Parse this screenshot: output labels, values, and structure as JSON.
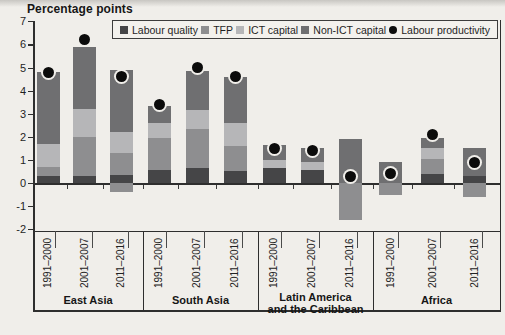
{
  "title": "Percentage points",
  "legend": {
    "items": [
      {
        "key": "labour_quality",
        "label": "Labour quality",
        "swatch": "square"
      },
      {
        "key": "tfp",
        "label": "TFP",
        "swatch": "square"
      },
      {
        "key": "ict_capital",
        "label": "ICT capital",
        "swatch": "square"
      },
      {
        "key": "non_ict_capital",
        "label": "Non-ICT capital",
        "swatch": "square"
      },
      {
        "key": "labour_productivity",
        "label": "Labour productivity",
        "swatch": "dot"
      }
    ]
  },
  "colors": {
    "labour_quality": "#454547",
    "tfp": "#8e8e90",
    "ict_capital": "#b6b6b8",
    "non_ict_capital": "#6f6f71",
    "labour_productivity": "#0b0b0b",
    "axis": "#2e2e2e",
    "paper": "#f0eeea"
  },
  "chart_data": {
    "type": "bar",
    "stacked": true,
    "title": "Percentage points",
    "ylabel": "Percentage points",
    "ylim": [
      -2,
      7
    ],
    "yticks": [
      7,
      6,
      5,
      4,
      3,
      2,
      1,
      0,
      -1,
      -2
    ],
    "grid": false,
    "legend_position": "top",
    "stack_order": [
      "labour_quality",
      "tfp",
      "ict_capital",
      "non_ict_capital"
    ],
    "periods": [
      "1991–2000",
      "2001–2007",
      "2011–2016"
    ],
    "groups": [
      {
        "label_lines": [
          "East Asia"
        ],
        "bars": [
          {
            "period": "1991–2000",
            "labour_quality": 0.3,
            "tfp": 0.4,
            "ict_capital": 1.0,
            "non_ict_capital": 3.1,
            "negative_segments": [],
            "labour_productivity": 4.8
          },
          {
            "period": "2001–2007",
            "labour_quality": 0.3,
            "tfp": 1.7,
            "ict_capital": 1.2,
            "non_ict_capital": 2.7,
            "negative_segments": [],
            "labour_productivity": 6.2
          },
          {
            "period": "2011–2016",
            "labour_quality": 0.35,
            "tfp": 0.95,
            "ict_capital": 0.9,
            "non_ict_capital": 2.7,
            "negative_segments": [
              {
                "category": "tfp",
                "value": -0.4
              }
            ],
            "labour_productivity": 4.6
          }
        ]
      },
      {
        "label_lines": [
          "South Asia"
        ],
        "bars": [
          {
            "period": "1991–2000",
            "labour_quality": 0.55,
            "tfp": 1.4,
            "ict_capital": 0.65,
            "non_ict_capital": 0.75,
            "negative_segments": [],
            "labour_productivity": 3.4
          },
          {
            "period": "2001–2007",
            "labour_quality": 0.65,
            "tfp": 1.7,
            "ict_capital": 0.8,
            "non_ict_capital": 1.7,
            "negative_segments": [],
            "labour_productivity": 5.0
          },
          {
            "period": "2011–2016",
            "labour_quality": 0.5,
            "tfp": 1.1,
            "ict_capital": 1.0,
            "non_ict_capital": 2.0,
            "negative_segments": [],
            "labour_productivity": 4.6
          }
        ]
      },
      {
        "label_lines": [
          "Latin America",
          "and the Caribbean"
        ],
        "bars": [
          {
            "period": "1991–2000",
            "labour_quality": 0.65,
            "tfp": 0,
            "ict_capital": 0.35,
            "non_ict_capital": 0.65,
            "negative_segments": [],
            "labour_productivity": 1.5
          },
          {
            "period": "2001–2007",
            "labour_quality": 0.55,
            "tfp": 0,
            "ict_capital": 0.35,
            "non_ict_capital": 0.6,
            "negative_segments": [],
            "labour_productivity": 1.4
          },
          {
            "period": "2011–2016",
            "labour_quality": 0,
            "tfp": 0,
            "ict_capital": 0,
            "non_ict_capital": 1.9,
            "negative_segments": [
              {
                "category": "tfp",
                "value": -1.6
              }
            ],
            "labour_productivity": 0.3
          }
        ]
      },
      {
        "label_lines": [
          "Africa"
        ],
        "bars": [
          {
            "period": "1991–2000",
            "labour_quality": 0,
            "tfp": 0,
            "ict_capital": 0,
            "non_ict_capital": 0.9,
            "negative_segments": [
              {
                "category": "tfp",
                "value": -0.5
              }
            ],
            "labour_productivity": 0.4
          },
          {
            "period": "2001–2007",
            "labour_quality": 0.4,
            "tfp": 0.65,
            "ict_capital": 0.45,
            "non_ict_capital": 0.45,
            "negative_segments": [],
            "labour_productivity": 2.1
          },
          {
            "period": "2011–2016",
            "labour_quality": 0.3,
            "tfp": 0,
            "ict_capital": 0,
            "non_ict_capital": 1.2,
            "negative_segments": [
              {
                "category": "tfp",
                "value": -0.6
              }
            ],
            "labour_productivity": 0.9
          }
        ]
      }
    ]
  }
}
